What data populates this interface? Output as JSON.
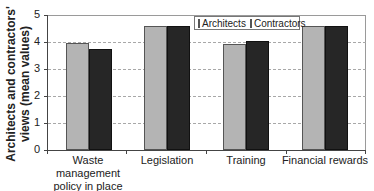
{
  "chart_data": {
    "type": "bar",
    "title": "",
    "xlabel": "",
    "ylabel": "Architects and contractors' views (mean values)",
    "ylabel_lines": [
      "Architects and contractors'",
      "views (mean values)"
    ],
    "categories": [
      "Waste management policy in place",
      "Legislation",
      "Training",
      "Financial rewards"
    ],
    "category_lines": [
      [
        "Waste",
        "management",
        "policy in place"
      ],
      [
        "Legislation"
      ],
      [
        "Training"
      ],
      [
        "Financial rewards"
      ]
    ],
    "series": [
      {
        "name": "Architects",
        "color": "#b4b4b4",
        "values": [
          3.95,
          4.6,
          3.92,
          4.6
        ]
      },
      {
        "name": "Contractors",
        "color": "#262626",
        "values": [
          3.75,
          4.6,
          4.05,
          4.6
        ]
      }
    ],
    "ylim": [
      0,
      5
    ],
    "yticks": [
      "0",
      "1",
      "2",
      "3",
      "4",
      "5"
    ],
    "grid": true,
    "legend_position": "top-right-inside"
  }
}
